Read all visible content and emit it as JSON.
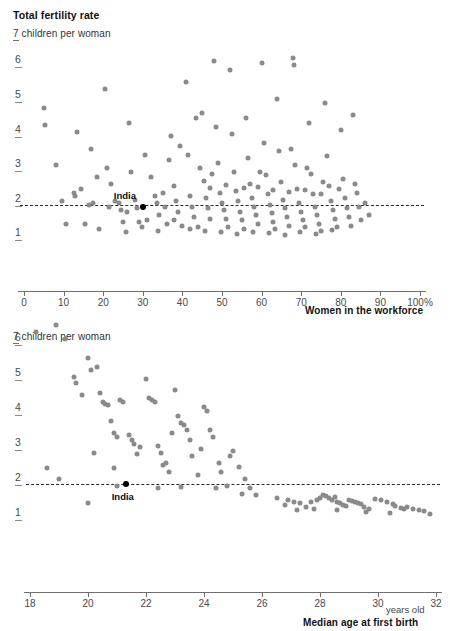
{
  "header": {
    "title": "Total fertility rate"
  },
  "chart_data": [
    {
      "type": "scatter",
      "id": "fertility-vs-workforce",
      "title": "Total fertility rate",
      "ylabel": "7 children per woman",
      "xlabel": "Women in the workforce",
      "xunit": "%",
      "xlim": [
        0,
        100
      ],
      "ylim": [
        0,
        7
      ],
      "xticks": [
        "0",
        "10",
        "20",
        "30",
        "40",
        "50",
        "60",
        "70",
        "80",
        "90",
        "100%"
      ],
      "xtick_values": [
        0,
        10,
        20,
        30,
        40,
        50,
        60,
        70,
        80,
        90,
        100
      ],
      "yticks": [
        "6",
        "5",
        "4",
        "3",
        "2",
        "1"
      ],
      "ytick_values": [
        6,
        5,
        4,
        3,
        2,
        1
      ],
      "grid": false,
      "legend": "none",
      "reference_line": {
        "y": 2.0,
        "style": "dashed",
        "color": "#2a2a2a"
      },
      "dot_color": "#8a8a8a",
      "highlight_color": "#000000",
      "annotations": [
        {
          "label": "India",
          "x": 30.0,
          "y": 1.95
        }
      ],
      "points": [
        [
          5.0,
          4.8
        ],
        [
          5.3,
          4.3
        ],
        [
          8.0,
          3.15
        ],
        [
          9.5,
          2.1
        ],
        [
          10.5,
          1.45
        ],
        [
          12.5,
          2.35
        ],
        [
          13.0,
          2.25
        ],
        [
          14.5,
          2.45
        ],
        [
          15.5,
          1.45
        ],
        [
          16.5,
          2.0
        ],
        [
          17.5,
          2.05
        ],
        [
          18.5,
          2.8
        ],
        [
          19.0,
          1.3
        ],
        [
          20.5,
          5.35
        ],
        [
          21.0,
          3.05
        ],
        [
          22.0,
          2.6
        ],
        [
          23.0,
          2.1
        ],
        [
          24.0,
          2.05
        ],
        [
          24.5,
          1.85
        ],
        [
          25.0,
          1.5
        ],
        [
          26.5,
          4.35
        ],
        [
          27.0,
          2.95
        ],
        [
          28.0,
          2.15
        ],
        [
          28.5,
          1.9
        ],
        [
          29.0,
          1.5
        ],
        [
          30.0,
          1.95
        ],
        [
          31.0,
          1.55
        ],
        [
          32.0,
          2.8
        ],
        [
          33.0,
          2.25
        ],
        [
          33.5,
          2.05
        ],
        [
          34.0,
          1.7
        ],
        [
          35.0,
          2.35
        ],
        [
          35.5,
          1.95
        ],
        [
          36.0,
          1.45
        ],
        [
          37.0,
          4.0
        ],
        [
          38.0,
          2.55
        ],
        [
          38.5,
          2.1
        ],
        [
          39.0,
          1.8
        ],
        [
          40.0,
          1.4
        ],
        [
          41.0,
          5.55
        ],
        [
          41.5,
          3.45
        ],
        [
          42.0,
          2.25
        ],
        [
          42.5,
          1.95
        ],
        [
          43.0,
          1.65
        ],
        [
          44.0,
          1.35
        ],
        [
          45.0,
          4.65
        ],
        [
          45.5,
          2.7
        ],
        [
          46.0,
          2.2
        ],
        [
          46.5,
          1.9
        ],
        [
          47.0,
          1.6
        ],
        [
          48.0,
          6.15
        ],
        [
          48.5,
          4.25
        ],
        [
          49.0,
          3.2
        ],
        [
          49.5,
          2.35
        ],
        [
          50.0,
          2.05
        ],
        [
          50.5,
          1.85
        ],
        [
          51.0,
          1.6
        ],
        [
          51.5,
          1.35
        ],
        [
          52.0,
          5.9
        ],
        [
          52.5,
          4.05
        ],
        [
          53.0,
          2.95
        ],
        [
          53.5,
          2.4
        ],
        [
          54.0,
          2.1
        ],
        [
          54.5,
          1.8
        ],
        [
          55.0,
          1.55
        ],
        [
          55.5,
          1.3
        ],
        [
          56.0,
          4.5
        ],
        [
          56.5,
          3.35
        ],
        [
          57.0,
          2.6
        ],
        [
          57.5,
          2.2
        ],
        [
          58.0,
          1.95
        ],
        [
          58.5,
          1.7
        ],
        [
          59.0,
          1.45
        ],
        [
          60.0,
          6.1
        ],
        [
          60.5,
          3.8
        ],
        [
          61.0,
          2.85
        ],
        [
          61.5,
          2.3
        ],
        [
          62.0,
          2.0
        ],
        [
          62.5,
          1.75
        ],
        [
          63.0,
          1.5
        ],
        [
          63.5,
          1.3
        ],
        [
          64.0,
          5.05
        ],
        [
          64.5,
          3.55
        ],
        [
          65.0,
          2.65
        ],
        [
          65.5,
          2.15
        ],
        [
          66.0,
          1.9
        ],
        [
          66.5,
          1.65
        ],
        [
          67.0,
          1.4
        ],
        [
          68.0,
          6.25
        ],
        [
          68.3,
          6.05
        ],
        [
          68.5,
          3.15
        ],
        [
          69.0,
          2.45
        ],
        [
          69.5,
          2.05
        ],
        [
          70.0,
          1.8
        ],
        [
          70.5,
          1.55
        ],
        [
          71.0,
          1.35
        ],
        [
          72.0,
          4.35
        ],
        [
          72.5,
          2.9
        ],
        [
          73.0,
          2.3
        ],
        [
          73.5,
          1.95
        ],
        [
          74.0,
          1.7
        ],
        [
          74.5,
          1.45
        ],
        [
          75.0,
          1.25
        ],
        [
          76.0,
          4.95
        ],
        [
          76.5,
          3.4
        ],
        [
          77.0,
          2.55
        ],
        [
          77.5,
          2.1
        ],
        [
          78.0,
          1.85
        ],
        [
          78.5,
          1.6
        ],
        [
          79.0,
          1.35
        ],
        [
          80.0,
          4.15
        ],
        [
          80.5,
          2.75
        ],
        [
          81.0,
          2.2
        ],
        [
          81.5,
          1.9
        ],
        [
          82.0,
          1.65
        ],
        [
          82.5,
          1.4
        ],
        [
          83.0,
          4.6
        ],
        [
          84.0,
          2.35
        ],
        [
          84.5,
          1.95
        ],
        [
          85.0,
          1.55
        ],
        [
          86.0,
          2.05
        ],
        [
          87.0,
          1.7
        ],
        [
          44.5,
          3.05
        ],
        [
          47.5,
          2.9
        ],
        [
          59.5,
          2.95
        ],
        [
          67.5,
          3.6
        ],
        [
          71.5,
          3.05
        ],
        [
          75.5,
          2.65
        ],
        [
          79.5,
          2.45
        ],
        [
          83.5,
          2.6
        ],
        [
          36.5,
          3.3
        ],
        [
          30.5,
          3.45
        ],
        [
          26.0,
          1.8
        ],
        [
          21.5,
          1.95
        ],
        [
          17.0,
          3.6
        ],
        [
          13.5,
          4.1
        ],
        [
          43.5,
          4.5
        ],
        [
          39.5,
          3.7
        ],
        [
          53.8,
          1.15
        ],
        [
          57.8,
          1.2
        ],
        [
          61.8,
          1.18
        ],
        [
          65.8,
          1.12
        ],
        [
          69.8,
          1.22
        ],
        [
          73.8,
          1.15
        ],
        [
          77.8,
          1.28
        ],
        [
          49.8,
          1.2
        ],
        [
          45.8,
          1.25
        ],
        [
          41.8,
          1.3
        ],
        [
          37.8,
          1.55
        ],
        [
          33.8,
          1.25
        ],
        [
          29.8,
          1.35
        ],
        [
          25.8,
          1.2
        ],
        [
          55.5,
          2.48
        ],
        [
          59.0,
          2.52
        ],
        [
          63.0,
          2.44
        ],
        [
          67.0,
          2.38
        ],
        [
          71.0,
          2.42
        ],
        [
          75.0,
          2.3
        ],
        [
          51.0,
          2.58
        ],
        [
          47.0,
          2.48
        ]
      ]
    },
    {
      "type": "scatter",
      "id": "fertility-vs-age-at-first-birth",
      "ylabel": "7 children per woman",
      "xlabel": "Median age at first birth",
      "xunit": "years old",
      "xlim": [
        18,
        32
      ],
      "ylim": [
        0,
        7
      ],
      "xticks": [
        "18",
        "20",
        "22",
        "24",
        "26",
        "28",
        "30",
        "32"
      ],
      "xtick_values": [
        18,
        20,
        22,
        24,
        26,
        28,
        30,
        32
      ],
      "yticks": [
        "6",
        "5",
        "4",
        "3",
        "2",
        "1"
      ],
      "ytick_values": [
        6,
        5,
        4,
        3,
        2,
        1
      ],
      "grid": false,
      "legend": "none",
      "reference_line": {
        "y": 2.0,
        "style": "dashed",
        "color": "#2a2a2a"
      },
      "dot_color": "#8a8a8a",
      "highlight_color": "#000000",
      "annotations": [
        {
          "label": "India",
          "x": 21.3,
          "y": 2.0
        }
      ],
      "points": [
        [
          18.2,
          6.35
        ],
        [
          18.9,
          6.55
        ],
        [
          19.2,
          6.15
        ],
        [
          19.5,
          5.05
        ],
        [
          19.6,
          4.9
        ],
        [
          19.8,
          4.55
        ],
        [
          20.0,
          5.6
        ],
        [
          20.1,
          5.25
        ],
        [
          20.3,
          5.35
        ],
        [
          20.4,
          4.6
        ],
        [
          20.5,
          4.35
        ],
        [
          20.6,
          4.3
        ],
        [
          20.7,
          4.25
        ],
        [
          20.8,
          3.8
        ],
        [
          20.9,
          3.45
        ],
        [
          21.0,
          3.35
        ],
        [
          21.1,
          4.4
        ],
        [
          21.2,
          4.35
        ],
        [
          21.3,
          2.0
        ],
        [
          21.4,
          3.4
        ],
        [
          21.5,
          3.25
        ],
        [
          21.6,
          3.15
        ],
        [
          21.7,
          2.85
        ],
        [
          21.8,
          3.05
        ],
        [
          22.0,
          5.0
        ],
        [
          22.1,
          4.45
        ],
        [
          22.2,
          4.4
        ],
        [
          22.3,
          4.35
        ],
        [
          22.4,
          3.1
        ],
        [
          22.5,
          2.9
        ],
        [
          22.6,
          2.55
        ],
        [
          22.7,
          2.6
        ],
        [
          22.8,
          2.35
        ],
        [
          23.0,
          4.7
        ],
        [
          23.1,
          3.95
        ],
        [
          23.2,
          3.75
        ],
        [
          23.3,
          3.7
        ],
        [
          23.4,
          3.55
        ],
        [
          23.5,
          3.25
        ],
        [
          23.6,
          2.8
        ],
        [
          23.8,
          2.25
        ],
        [
          24.0,
          4.2
        ],
        [
          24.1,
          4.1
        ],
        [
          24.2,
          3.55
        ],
        [
          24.3,
          3.35
        ],
        [
          24.5,
          2.6
        ],
        [
          24.6,
          2.35
        ],
        [
          24.8,
          1.95
        ],
        [
          25.0,
          2.95
        ],
        [
          25.2,
          2.5
        ],
        [
          25.4,
          2.15
        ],
        [
          25.6,
          1.9
        ],
        [
          25.8,
          1.7
        ],
        [
          18.6,
          2.45
        ],
        [
          19.0,
          2.15
        ],
        [
          20.2,
          2.9
        ],
        [
          20.9,
          2.45
        ],
        [
          22.9,
          3.45
        ],
        [
          23.9,
          3.0
        ],
        [
          24.9,
          2.8
        ],
        [
          26.9,
          1.55
        ],
        [
          27.1,
          1.5
        ],
        [
          27.3,
          1.45
        ],
        [
          27.5,
          1.35
        ],
        [
          27.7,
          1.5
        ],
        [
          27.9,
          1.55
        ],
        [
          28.0,
          1.6
        ],
        [
          28.1,
          1.7
        ],
        [
          28.2,
          1.65
        ],
        [
          28.3,
          1.6
        ],
        [
          28.4,
          1.55
        ],
        [
          28.5,
          1.62
        ],
        [
          28.6,
          1.5
        ],
        [
          28.7,
          1.45
        ],
        [
          28.8,
          1.4
        ],
        [
          28.9,
          1.38
        ],
        [
          29.0,
          1.55
        ],
        [
          29.1,
          1.52
        ],
        [
          29.2,
          1.48
        ],
        [
          29.3,
          1.45
        ],
        [
          29.4,
          1.42
        ],
        [
          29.5,
          1.35
        ],
        [
          29.7,
          1.3
        ],
        [
          29.9,
          1.58
        ],
        [
          30.1,
          1.55
        ],
        [
          30.3,
          1.5
        ],
        [
          30.5,
          1.42
        ],
        [
          30.6,
          1.38
        ],
        [
          30.8,
          1.32
        ],
        [
          30.9,
          1.3
        ],
        [
          31.0,
          1.35
        ],
        [
          31.2,
          1.28
        ],
        [
          31.4,
          1.25
        ],
        [
          31.6,
          1.22
        ],
        [
          31.8,
          1.15
        ],
        [
          27.2,
          1.25
        ],
        [
          27.8,
          1.28
        ],
        [
          28.6,
          1.25
        ],
        [
          29.6,
          1.2
        ],
        [
          30.4,
          1.18
        ],
        [
          26.5,
          1.6
        ],
        [
          26.8,
          1.4
        ],
        [
          22.4,
          1.9
        ],
        [
          23.2,
          1.92
        ],
        [
          24.4,
          1.88
        ],
        [
          25.3,
          1.72
        ],
        [
          21.0,
          1.95
        ],
        [
          20.0,
          1.45
        ]
      ]
    }
  ]
}
